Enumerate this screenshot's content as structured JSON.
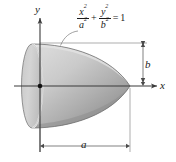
{
  "figure": {
    "type": "math-solid-diagram",
    "width": 176,
    "height": 162,
    "background_color": "#ffffff"
  },
  "axes": {
    "x_label": "x",
    "y_label": "y",
    "origin_marker": "origin-dot",
    "x_axis": {
      "y": 86,
      "x_start": 14,
      "x_end": 160,
      "arrow": "right"
    },
    "y_axis": {
      "x": 40,
      "y_start": 16,
      "y_end": 152,
      "arrow": "up"
    }
  },
  "equation": {
    "numerator_1": "x",
    "numerator_1_exp": "2",
    "denominator_1": "a",
    "denominator_1_exp": "2",
    "operator": "+",
    "numerator_2": "y",
    "numerator_2_exp": "2",
    "denominator_2": "b",
    "denominator_2_exp": "2",
    "equals": "=",
    "right_hand_side": "1",
    "full_text": "x^2/a^2 + y^2/b^2 = 1"
  },
  "dimensions": [
    {
      "label": "b",
      "orientation": "vertical",
      "from": [
        143,
        43
      ],
      "to": [
        143,
        86
      ]
    },
    {
      "label": "a",
      "orientation": "horizontal",
      "from": [
        40,
        146
      ],
      "to": [
        130,
        146
      ]
    }
  ],
  "solid": {
    "name": "paraboloid-like-solid",
    "fill_light": "#d2d2d2",
    "fill_dark": "#8c8c8c",
    "outline_color": "#6e6e6e",
    "left_face": {
      "name": "elliptical-cross-section",
      "cx": 32,
      "cy": 86,
      "rx": 10,
      "ry": 42
    },
    "apex": [
      130,
      86
    ],
    "top_extent": [
      40,
      43
    ]
  },
  "leader_line": {
    "name": "equation-leader",
    "from": [
      76,
      30
    ],
    "to": [
      62,
      45
    ]
  },
  "colors": {
    "line": "#3a3a3a",
    "thin_line": "#8a8a8a",
    "text": "#1a1a1a"
  }
}
